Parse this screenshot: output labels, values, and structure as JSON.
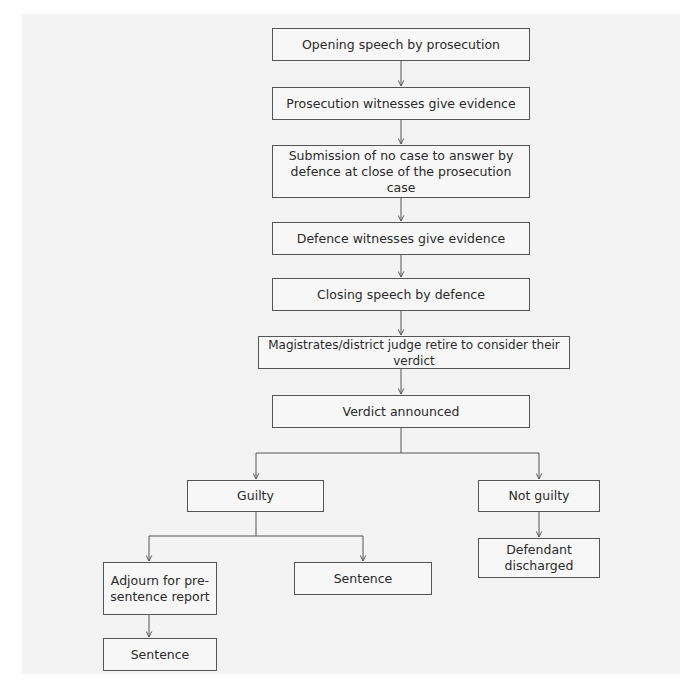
{
  "diagram": {
    "type": "flowchart",
    "nodes": {
      "opening": "Opening speech by prosecution",
      "prosecution_witnesses": "Prosecution witnesses give evidence",
      "no_case_line1": "Submission of no case to answer by",
      "no_case_line2": "defence at close of the prosecution case",
      "defence_witnesses": "Defence witnesses give evidence",
      "closing": "Closing speech by defence",
      "retire": "Magistrates/district judge retire to consider their verdict",
      "verdict": "Verdict announced",
      "guilty": "Guilty",
      "not_guilty": "Not guilty",
      "adjourn_line1": "Adjourn for pre-",
      "adjourn_line2": "sentence report",
      "sentence_direct": "Sentence",
      "defendant_line1": "Defendant",
      "defendant_line2": "discharged",
      "sentence_after_report": "Sentence"
    },
    "edges": [
      [
        "opening",
        "prosecution_witnesses"
      ],
      [
        "prosecution_witnesses",
        "no_case"
      ],
      [
        "no_case",
        "defence_witnesses"
      ],
      [
        "defence_witnesses",
        "closing"
      ],
      [
        "closing",
        "retire"
      ],
      [
        "retire",
        "verdict"
      ],
      [
        "verdict",
        "guilty"
      ],
      [
        "verdict",
        "not_guilty"
      ],
      [
        "guilty",
        "adjourn"
      ],
      [
        "guilty",
        "sentence_direct"
      ],
      [
        "not_guilty",
        "defendant_discharged"
      ],
      [
        "adjourn",
        "sentence_after_report"
      ]
    ]
  }
}
